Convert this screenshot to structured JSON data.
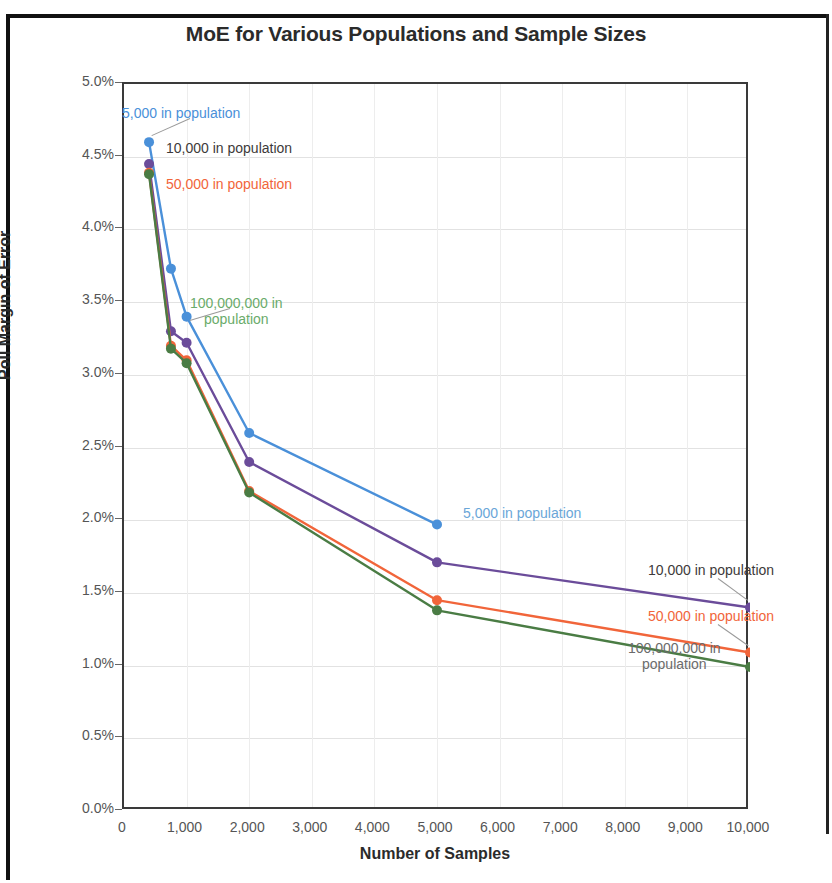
{
  "chart_data": {
    "type": "line",
    "title": "MoE for Various Populations and Sample Sizes",
    "xlabel": "Number of Samples",
    "ylabel": "Poll Margin of Error",
    "xlim": [
      0,
      10000
    ],
    "ylim": [
      0,
      5
    ],
    "grid": true,
    "legend_position": "inline-labels",
    "x_tick_labels": [
      "0",
      "1,000",
      "2,000",
      "3,000",
      "4,000",
      "5,000",
      "6,000",
      "7,000",
      "8,000",
      "9,000",
      "10,000"
    ],
    "x_tick_values": [
      0,
      1000,
      2000,
      3000,
      4000,
      5000,
      6000,
      7000,
      8000,
      9000,
      10000
    ],
    "y_tick_labels": [
      "0.0%",
      "0.5%",
      "1.0%",
      "1.5%",
      "2.0%",
      "2.5%",
      "3.0%",
      "3.5%",
      "4.0%",
      "4.5%",
      "5.0%"
    ],
    "y_tick_values": [
      0,
      0.5,
      1.0,
      1.5,
      2.0,
      2.5,
      3.0,
      3.5,
      4.0,
      4.5,
      5.0
    ],
    "series": [
      {
        "name": "5,000 in population",
        "color": "#4a90d9",
        "x": [
          400,
          750,
          1000,
          2000,
          5000
        ],
        "values": [
          4.6,
          3.73,
          3.4,
          2.6,
          1.97
        ]
      },
      {
        "name": "10,000 in population",
        "color": "#6b4c9a",
        "x": [
          400,
          750,
          1000,
          2000,
          5000,
          10000
        ],
        "values": [
          4.45,
          3.3,
          3.22,
          2.4,
          1.71,
          1.4
        ]
      },
      {
        "name": "50,000 in population",
        "color": "#f1653a",
        "x": [
          400,
          750,
          1000,
          2000,
          5000,
          10000
        ],
        "values": [
          4.39,
          3.2,
          3.1,
          2.2,
          1.45,
          1.09
        ]
      },
      {
        "name": "100,000,000 in population",
        "color": "#4a7c44",
        "x": [
          400,
          750,
          1000,
          2000,
          5000,
          10000
        ],
        "values": [
          4.38,
          3.18,
          3.08,
          2.19,
          1.38,
          0.99
        ]
      }
    ],
    "annotations": [
      {
        "text": "5,000 in population",
        "color": "#4a90d9",
        "side": "left"
      },
      {
        "text": "10,000 in population",
        "color": "#3d3a3a",
        "side": "left"
      },
      {
        "text": "50,000 in population",
        "color": "#f1653a",
        "side": "left"
      },
      {
        "text": "100,000,000 in population",
        "color": "#6aab6a",
        "side": "left"
      },
      {
        "text": "5,000 in population",
        "color": "#6aa6d8",
        "side": "right"
      },
      {
        "text": "10,000 in population",
        "color": "#3d3a3a",
        "side": "right"
      },
      {
        "text": "50,000 in population",
        "color": "#f1653a",
        "side": "right"
      },
      {
        "text": "100,000,000 in population",
        "color": "#6b6b6b",
        "side": "right"
      }
    ]
  },
  "labels": {
    "left_5000": "5,000 in population",
    "left_10000": "10,000 in population",
    "left_50000": "50,000 in population",
    "left_100m_line1": "100,000,000 in",
    "left_100m_line2": "population",
    "right_5000": "5,000 in population",
    "right_10000": "10,000 in population",
    "right_50000": "50,000 in population",
    "right_100m_line1": "100,000,000 in",
    "right_100m_line2": "population"
  }
}
